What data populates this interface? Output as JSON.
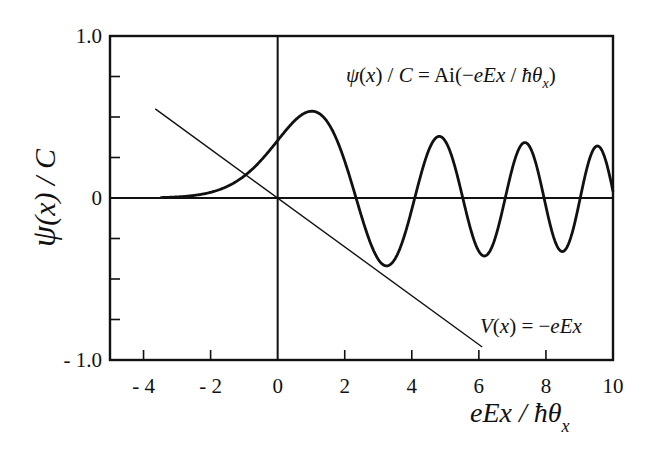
{
  "chart_data": {
    "type": "line",
    "title": "",
    "xlabel": "eEx / ħθ_x",
    "ylabel": "ψ(x) / C",
    "xlim": [
      -5,
      10
    ],
    "ylim": [
      -1.0,
      1.0
    ],
    "grid": false,
    "legend": "none",
    "x_ticks": [
      -4,
      -2,
      0,
      2,
      4,
      6,
      8,
      10
    ],
    "x_tick_labels": [
      "- 4",
      "- 2",
      "0",
      "2",
      "4",
      "6",
      "8",
      "10"
    ],
    "y_ticks": [
      -1.0,
      -0.75,
      -0.5,
      -0.25,
      0,
      0.25,
      0.5,
      0.75,
      1.0
    ],
    "y_tick_labels": [
      "- 1.0",
      "",
      "",
      "",
      "0",
      "",
      "",
      "",
      "1.0"
    ],
    "series": [
      {
        "name": "ψ(x) / C = Ai(−eEx / ħθ_x)",
        "style": "thick",
        "x_range": [
          -3.5,
          10
        ],
        "x": [
          -3.5,
          -3.0,
          -2.5,
          -2.0,
          -1.5,
          -1.0,
          -0.5,
          0.0,
          0.5,
          1.0,
          1.5,
          2.0,
          2.34,
          2.5,
          3.0,
          3.25,
          3.5,
          4.09,
          4.5,
          4.84,
          5.0,
          5.5,
          5.52,
          6.0,
          6.17,
          6.5,
          6.79,
          7.0,
          7.37,
          7.5,
          7.94,
          8.0,
          8.5,
          8.8,
          9.0,
          9.02,
          9.5,
          10.0
        ],
        "values": [
          0.001,
          0.007,
          0.016,
          0.035,
          0.072,
          0.135,
          0.232,
          0.355,
          0.475,
          0.535,
          0.464,
          0.227,
          0.0,
          -0.097,
          -0.379,
          -0.419,
          -0.33,
          0.0,
          0.308,
          0.38,
          0.351,
          0.0,
          0.0,
          -0.33,
          -0.34,
          -0.165,
          0.0,
          0.184,
          0.314,
          0.285,
          0.0,
          -0.053,
          -0.292,
          -0.243,
          0.0,
          0.0,
          0.289,
          0.042
        ]
      },
      {
        "name": "V(x) = −eEx",
        "style": "thin",
        "x": [
          -3.65,
          6.1
        ],
        "values": [
          0.55,
          -0.92
        ]
      }
    ],
    "annotations": [
      {
        "text": "ψ(x) / C = Ai(−eEx / ħθ_x)",
        "x": 6.0,
        "y": 0.73
      },
      {
        "text": "V(x) = −eEx",
        "x": 7.4,
        "y": -0.81
      }
    ]
  },
  "labels": {
    "ylabel_psi": "ψ",
    "ylabel_rest": "(x) / C",
    "xlabel_main": "eEx / ħθ",
    "xlabel_sub": "x",
    "psi_annot_a": "ψ",
    "psi_annot_b": "(",
    "psi_annot_c": "x",
    "psi_annot_d": ") / ",
    "psi_annot_e": "C",
    "psi_annot_f": " = Ai(−",
    "psi_annot_g": "eEx",
    "psi_annot_h": " / ",
    "psi_annot_i": "ħθ",
    "psi_annot_j": "x",
    "psi_annot_k": ")",
    "v_annot_a": "V",
    "v_annot_b": "(",
    "v_annot_c": "x",
    "v_annot_d": ") = −",
    "v_annot_e": "eEx"
  },
  "colors": {
    "ink": "#111111",
    "background": "#ffffff"
  }
}
